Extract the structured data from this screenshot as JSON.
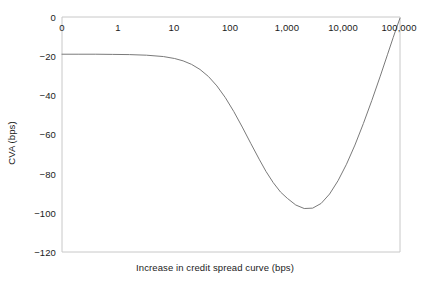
{
  "chart_data": {
    "type": "line",
    "title": "",
    "xlabel": "Increase in credit spread curve (bps)",
    "ylabel": "CVA (bps)",
    "x_scale": "log-style categorical (evenly spaced decades)",
    "x_tick_labels": [
      "0",
      "1",
      "10",
      "100",
      "1,000",
      "10,000",
      "100,000"
    ],
    "y_tick_labels": [
      "0",
      "-20",
      "-40",
      "-60",
      "-80",
      "-100",
      "-120"
    ],
    "y_tick_values": [
      0,
      -20,
      -40,
      -60,
      -80,
      -100,
      -120
    ],
    "ylim": [
      -120,
      0
    ],
    "xlim": [
      0,
      6
    ],
    "grid": false,
    "legend": false,
    "series": [
      {
        "name": "CVA",
        "color": "#7a7a7a",
        "line_width": 1,
        "x_positions": [
          0.0,
          0.3,
          0.6,
          0.9,
          1.2,
          1.5,
          1.8,
          2.0,
          2.15,
          2.3,
          2.45,
          2.6,
          2.75,
          2.9,
          3.05,
          3.2,
          3.35,
          3.5,
          3.62,
          3.75,
          3.88,
          4.0,
          4.15,
          4.3,
          4.45,
          4.6,
          4.75,
          4.9,
          5.05,
          5.2,
          5.35,
          5.5,
          5.65,
          5.78,
          5.88,
          5.95,
          6.0
        ],
        "values": [
          -19.0,
          -19.0,
          -19.0,
          -19.1,
          -19.2,
          -19.5,
          -20.2,
          -21.2,
          -22.4,
          -24.2,
          -26.8,
          -30.4,
          -35.2,
          -41.2,
          -48.3,
          -56.2,
          -64.5,
          -72.6,
          -78.8,
          -84.6,
          -89.4,
          -92.6,
          -96.0,
          -97.8,
          -97.6,
          -95.2,
          -90.4,
          -83.6,
          -75.2,
          -65.4,
          -54.4,
          -42.6,
          -30.2,
          -19.0,
          -10.4,
          -4.6,
          -0.6
        ]
      }
    ],
    "annotations": {
      "plateau_value": -19,
      "minimum_value": -98,
      "minimum_x_label": "~2,000",
      "endpoint_value": 0
    }
  },
  "axes": {
    "x_ticks": [
      {
        "label": "0",
        "px": 62
      },
      {
        "label": "1",
        "px": 118
      },
      {
        "label": "10",
        "px": 174
      },
      {
        "label": "100",
        "px": 230
      },
      {
        "label": "1,000",
        "px": 287
      },
      {
        "label": "10,000",
        "px": 343
      },
      {
        "label": "100,000",
        "px": 399
      }
    ],
    "y_ticks": [
      {
        "label": "0",
        "px": 17
      },
      {
        "label": "-20",
        "px": 56
      },
      {
        "label": "-40",
        "px": 95
      },
      {
        "label": "-60",
        "px": 134
      },
      {
        "label": "-80",
        "px": 174
      },
      {
        "label": "-100",
        "px": 213
      },
      {
        "label": "-120",
        "px": 252
      }
    ]
  },
  "colors": {
    "curve": "#7a7a7a",
    "frame": "#c8c8c8",
    "text": "#1b1b1b",
    "background": "#ffffff"
  }
}
